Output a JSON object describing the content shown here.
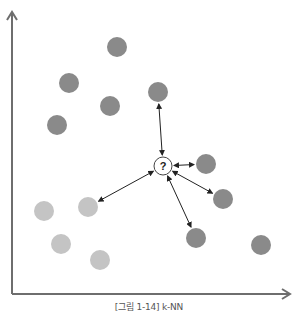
{
  "caption": "[그림 1-14] k-NN",
  "colors": {
    "axis": "#6e6e6e",
    "dark_point": "#8a8a8a",
    "light_point": "#c4c4c4",
    "query_stroke": "#444444",
    "arrow": "#222222"
  },
  "query": {
    "label": "?",
    "x": 163,
    "y": 166,
    "r": 9
  },
  "dark_points": [
    {
      "x": 117,
      "y": 47
    },
    {
      "x": 69,
      "y": 83
    },
    {
      "x": 110,
      "y": 106
    },
    {
      "x": 57,
      "y": 125
    },
    {
      "x": 158,
      "y": 92
    },
    {
      "x": 206,
      "y": 164
    },
    {
      "x": 223,
      "y": 199
    },
    {
      "x": 196,
      "y": 238
    },
    {
      "x": 261,
      "y": 245
    }
  ],
  "light_points": [
    {
      "x": 44,
      "y": 211
    },
    {
      "x": 88,
      "y": 207
    },
    {
      "x": 61,
      "y": 244
    },
    {
      "x": 100,
      "y": 260
    }
  ],
  "neighbors": [
    {
      "x": 158,
      "y": 92
    },
    {
      "x": 206,
      "y": 164
    },
    {
      "x": 223,
      "y": 199
    },
    {
      "x": 196,
      "y": 238
    },
    {
      "x": 88,
      "y": 207
    }
  ]
}
